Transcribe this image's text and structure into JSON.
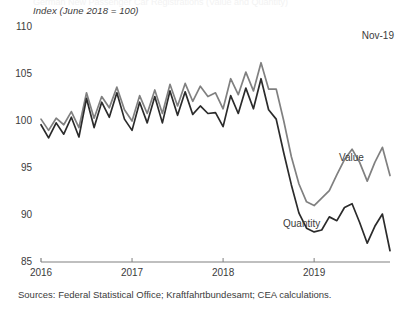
{
  "chart": {
    "axis_title": "Index (June 2018 = 100)",
    "corner_note": "Nov-19",
    "sources": "Sources: Federal Statistical Office; Kraftfahrtbundesamt; CEA calculations.",
    "ghost_title": "German New Passenger Car Registrations (Value and Quantity)",
    "label_value": "Value",
    "label_quantity": "Quantity",
    "colors": {
      "value_line": "#808080",
      "quantity_line": "#2b2b2b",
      "axis": "#808080",
      "text": "#3b3b3b"
    }
  },
  "chart_data": {
    "type": "line",
    "title": "",
    "xlabel": "",
    "ylabel": "Index (June 2018 = 100)",
    "ylim": [
      85,
      110
    ],
    "yticks": [
      85,
      90,
      95,
      100,
      105,
      110
    ],
    "xticks": [
      "2016",
      "2017",
      "2018",
      "2019"
    ],
    "xtick_positions": [
      0,
      12,
      24,
      36
    ],
    "xlim": [
      0,
      47
    ],
    "grid": false,
    "legend": "inline-labels",
    "annotations": [
      {
        "text": "Nov-19",
        "position": "top-right"
      }
    ],
    "x": [
      "2016-01",
      "2016-02",
      "2016-03",
      "2016-04",
      "2016-05",
      "2016-06",
      "2016-07",
      "2016-08",
      "2016-09",
      "2016-10",
      "2016-11",
      "2016-12",
      "2017-01",
      "2017-02",
      "2017-03",
      "2017-04",
      "2017-05",
      "2017-06",
      "2017-07",
      "2017-08",
      "2017-09",
      "2017-10",
      "2017-11",
      "2017-12",
      "2018-01",
      "2018-02",
      "2018-03",
      "2018-04",
      "2018-05",
      "2018-06",
      "2018-07",
      "2018-08",
      "2018-09",
      "2018-10",
      "2018-11",
      "2018-12",
      "2019-01",
      "2019-02",
      "2019-03",
      "2019-04",
      "2019-05",
      "2019-06",
      "2019-07",
      "2019-08",
      "2019-09",
      "2019-10",
      "2019-11"
    ],
    "series": [
      {
        "name": "Value",
        "color": "#808080",
        "values": [
          100.2,
          99.0,
          100.3,
          99.6,
          101.0,
          99.3,
          103.0,
          100.3,
          102.6,
          101.4,
          103.6,
          101.2,
          100.0,
          102.7,
          100.8,
          103.3,
          100.8,
          103.9,
          101.6,
          104.0,
          102.1,
          103.7,
          102.6,
          103.0,
          101.3,
          104.5,
          102.8,
          105.2,
          103.2,
          106.2,
          103.4,
          103.4,
          100.0,
          96.2,
          93.3,
          91.4,
          91.0,
          91.8,
          92.6,
          94.3,
          95.9,
          97.0,
          95.6,
          93.6,
          95.6,
          97.2,
          94.2
        ]
      },
      {
        "name": "Quantity",
        "color": "#2b2b2b",
        "values": [
          99.6,
          98.2,
          99.8,
          98.6,
          100.4,
          98.3,
          102.4,
          99.3,
          102.0,
          100.4,
          103.0,
          100.2,
          99.0,
          102.0,
          99.8,
          102.6,
          99.8,
          103.2,
          100.6,
          103.1,
          100.7,
          101.6,
          100.8,
          100.9,
          99.4,
          102.7,
          100.8,
          103.5,
          101.3,
          104.5,
          101.2,
          100.2,
          96.6,
          93.2,
          90.2,
          88.6,
          88.2,
          88.4,
          89.8,
          89.4,
          90.8,
          91.2,
          89.2,
          87.0,
          88.8,
          90.1,
          86.2
        ]
      }
    ]
  }
}
